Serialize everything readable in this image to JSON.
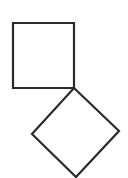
{
  "diagram": {
    "stroke_color": "#2b2b2b",
    "background": "#ffffff",
    "shapes": [
      {
        "name": "square",
        "points": "13,23 74,23 74,88 13,88"
      },
      {
        "name": "diamond",
        "points": "74,88 119,131 76,177 32,134"
      }
    ]
  }
}
